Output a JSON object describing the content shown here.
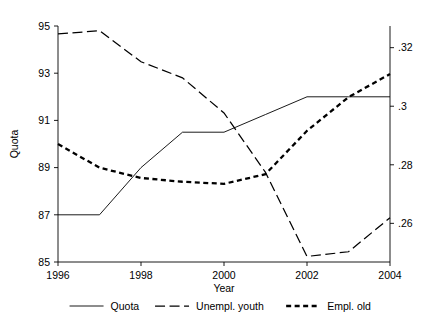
{
  "chart_data": {
    "type": "line",
    "title": "",
    "xlabel": "Year",
    "ylabel": "Quota",
    "y2label": "",
    "x": [
      1996,
      1997,
      1998,
      1999,
      2000,
      2001,
      2002,
      2003,
      2004
    ],
    "xlim": [
      1996,
      2004
    ],
    "xticks": [
      1996,
      1998,
      2000,
      2002,
      2004
    ],
    "xticklabels": [
      "1996",
      "1998",
      "2000",
      "2002",
      "2004"
    ],
    "ylim": [
      85,
      95
    ],
    "yticks": [
      85,
      87,
      89,
      91,
      93,
      95
    ],
    "yticklabels": [
      "85",
      "87",
      "89",
      "91",
      "93",
      "95"
    ],
    "y2lim": [
      0.2468,
      0.3274
    ],
    "y2ticks": [
      0.26,
      0.28,
      0.3,
      0.32
    ],
    "y2ticklabels": [
      ".26",
      ".28",
      ".3",
      ".32"
    ],
    "grid": false,
    "legend_position": "bottom",
    "series": [
      {
        "name": "Quota",
        "axis": "left",
        "style": "solid",
        "values": [
          87,
          87,
          89,
          90.5,
          90.5,
          91.25,
          92,
          92,
          92
        ]
      },
      {
        "name": "Unempl. youth",
        "axis": "right",
        "style": "long-dash",
        "values": [
          0.3247,
          0.3258,
          0.3152,
          0.3097,
          0.2977,
          0.2774,
          0.2487,
          0.2503,
          0.2619
        ]
      },
      {
        "name": "Empl. old",
        "axis": "right",
        "style": "short-dash",
        "values": [
          0.2871,
          0.279,
          0.2755,
          0.2742,
          0.2735,
          0.2768,
          0.2916,
          0.3031,
          0.311
        ]
      }
    ]
  },
  "legend": {
    "items": [
      {
        "label": "Quota",
        "style": "solid"
      },
      {
        "label": "Unempl. youth",
        "style": "long-dash"
      },
      {
        "label": "Empl. old",
        "style": "short-dash"
      }
    ]
  }
}
